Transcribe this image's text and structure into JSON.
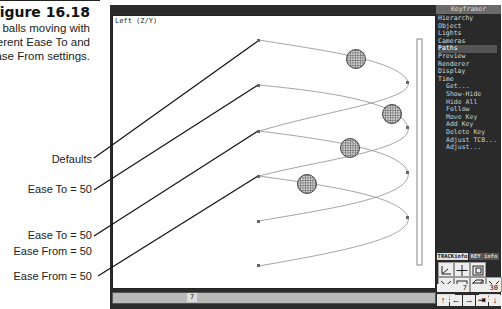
{
  "caption": {
    "figure": "Figure 16.18",
    "description": "The balls moving with different Ease To and Ease From settings."
  },
  "callouts": [
    {
      "text": "Defaults"
    },
    {
      "text": "Ease To = 50"
    },
    {
      "text": "Ease To = 50"
    },
    {
      "text": "Ease From = 50"
    },
    {
      "text": "Ease From = 50"
    }
  ],
  "viewport": {
    "title": "Left (Z/Y)"
  },
  "frame_bar": {
    "current_frame": "7"
  },
  "panel": {
    "header": "Keyframer",
    "menu": [
      {
        "label": "Hierarchy"
      },
      {
        "label": "Object"
      },
      {
        "label": "Lights"
      },
      {
        "label": "Cameras"
      },
      {
        "label": "Paths",
        "active": true
      },
      {
        "label": "Preview"
      },
      {
        "label": "Renderer"
      },
      {
        "label": "Display"
      },
      {
        "label": "Time"
      }
    ],
    "submenu": [
      {
        "label": "Get..."
      },
      {
        "label": "Show-Hide"
      },
      {
        "label": "Hide All"
      },
      {
        "label": "Follow"
      },
      {
        "label": "Move Key"
      },
      {
        "label": "Add Key"
      },
      {
        "label": "Delete Key"
      },
      {
        "label": "Adjust TCB..."
      },
      {
        "label": "Adjust..."
      }
    ],
    "tabs": {
      "track_info": "TRACKinfo",
      "key_info": "KEY info"
    },
    "icons": [
      "axis-icon",
      "move-icon",
      "zoom-region-icon",
      "zoom-extents-icon",
      "region-icon",
      "zoom-window-icon",
      "fit-icon"
    ],
    "hold_label": "HOLD",
    "fetch_label": "FETCH",
    "current_frame": "7",
    "total_frames": "30",
    "nav_buttons": [
      "↑",
      "←",
      "→",
      "⇥",
      "↓"
    ]
  },
  "colors": {
    "panel_bg": "#2a2a2a",
    "panel_active": "#555555",
    "viewport_bg": "#ffffff",
    "frame_bar": "#b9b9b9"
  }
}
